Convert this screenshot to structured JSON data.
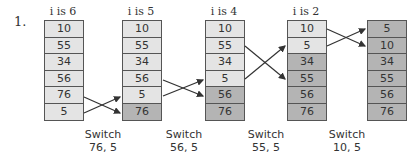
{
  "problem_number": "1.",
  "steps": [
    {
      "label": "i is 6",
      "values": [
        "10",
        "55",
        "34",
        "56",
        "76",
        "5"
      ],
      "sorted_from": 6
    },
    {
      "label": "i is 5",
      "values": [
        "10",
        "55",
        "34",
        "56",
        "5",
        "76"
      ],
      "sorted_from": 5
    },
    {
      "label": "i is 4",
      "values": [
        "10",
        "55",
        "34",
        "5",
        "56",
        "76"
      ],
      "sorted_from": 4
    },
    {
      "label": "i is 2",
      "values": [
        "10",
        "5",
        "34",
        "55",
        "56",
        "76"
      ],
      "sorted_from": 2
    },
    {
      "label": "",
      "values": [
        "5",
        "10",
        "34",
        "55",
        "56",
        "76"
      ],
      "sorted_from": 0
    }
  ],
  "switches": [
    {
      "line1": "Switch",
      "line2": "76, 5"
    },
    {
      "line1": "Switch",
      "line2": "56, 5"
    },
    {
      "line1": "Switch",
      "line2": "55, 5"
    },
    {
      "line1": "Switch",
      "line2": "10, 5"
    }
  ],
  "colors": {
    "unsorted": "#e4e4e4",
    "sorted": "#b4b4b4",
    "border": "#555555"
  }
}
